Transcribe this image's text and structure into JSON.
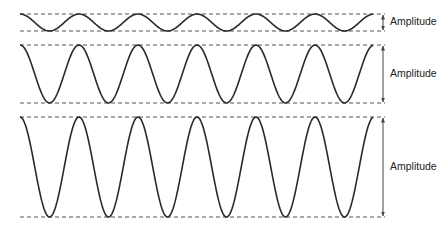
{
  "title": "",
  "colors": {
    "wave": "#2a2a2a",
    "guide": "#555555",
    "text": "#222222",
    "background": "#ffffff"
  },
  "layout": {
    "x_start": 20,
    "x_end": 373,
    "guide_end": 385,
    "arrow_x": 383,
    "period": 59
  },
  "waves": [
    {
      "id": "small",
      "label": "Amplitude",
      "top": 14,
      "bottom": 31,
      "label_y": 22
    },
    {
      "id": "medium",
      "label": "Amplitude",
      "top": 45,
      "bottom": 103,
      "label_y": 74
    },
    {
      "id": "large",
      "label": "Amplitude",
      "top": 117,
      "bottom": 217,
      "label_y": 167
    }
  ]
}
